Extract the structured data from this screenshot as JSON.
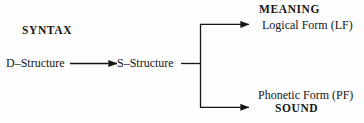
{
  "diagram": {
    "stroke_color": "#161616",
    "background_color": "#fdfdfd",
    "labels": {
      "syntax": "SYNTAX",
      "d_structure": "D–Structure",
      "s_structure": "S–Structure",
      "meaning": "MEANING",
      "logical_form": "Logical Form (LF)",
      "phonetic_form": "Phonetic Form (PF)",
      "sound": "SOUND"
    },
    "connectors": [
      {
        "name": "d-to-s-arrow",
        "from": "D–Structure",
        "to": "S–Structure",
        "arrowhead": true
      },
      {
        "name": "s-to-branch-line",
        "from": "S–Structure",
        "to": "branch-point",
        "arrowhead": false
      },
      {
        "name": "branch-to-lf-arrow",
        "from": "branch-point",
        "to": "Logical Form (LF)",
        "arrowhead": true
      },
      {
        "name": "branch-to-pf-arrow",
        "from": "branch-point",
        "to": "Phonetic Form (PF)",
        "arrowhead": true
      }
    ]
  }
}
